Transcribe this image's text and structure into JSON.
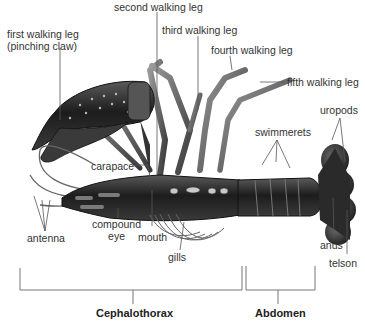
{
  "figure": {
    "colors": {
      "background": "#ffffff",
      "body_dark": "#1e1e1e",
      "body_mid": "#4a4a4a",
      "body_light": "#8a8a8a",
      "leader_line": "#555555",
      "label_text": "#333333"
    }
  },
  "labels": {
    "first_walking_leg": [
      "first walking leg",
      "(pinching claw)"
    ],
    "second_walking_leg": "second walking leg",
    "third_walking_leg": "third walking leg",
    "fourth_walking_leg": "fourth walking leg",
    "fifth_walking_leg": "fifth walking leg",
    "uropods": "uropods",
    "swimmerets": "swimmerets",
    "carapace": "carapace",
    "compound_eye": [
      "compound",
      "eye"
    ],
    "antenna": "antenna",
    "mouth": "mouth",
    "gills": "gills",
    "anus": "anus",
    "telson": "telson"
  },
  "regions": {
    "cephalothorax": "Cephalothorax",
    "abdomen": "Abdomen"
  }
}
